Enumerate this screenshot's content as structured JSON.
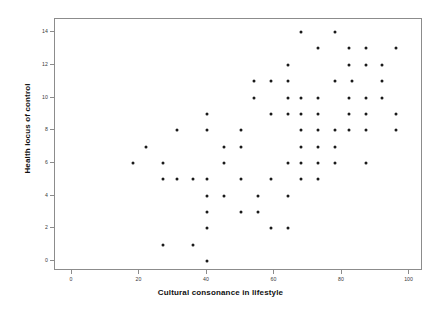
{
  "chart_data": {
    "type": "scatter",
    "title": "",
    "xlabel": "Cultural consonance in lifestyle",
    "ylabel": "Health locus of control",
    "xlim": [
      -5,
      104
    ],
    "ylim": [
      -0.6,
      14.8
    ],
    "xticks": [
      0,
      20,
      40,
      60,
      80,
      100
    ],
    "yticks": [
      0,
      2,
      4,
      6,
      8,
      10,
      12,
      14
    ],
    "xtick_labels": [
      "0",
      "20",
      "40",
      "60",
      "80",
      "100"
    ],
    "ytick_labels": [
      "0",
      "2",
      "4",
      "6",
      "8",
      "10",
      "12",
      "14"
    ],
    "grid": false,
    "legend": null,
    "marker": {
      "shape": "circle",
      "color": "#1a1a1a",
      "size": 3
    },
    "frame_color": "#8c8c8c",
    "background": "#ffffff",
    "points": [
      {
        "x": 68,
        "y": 14
      },
      {
        "x": 78,
        "y": 14
      },
      {
        "x": 73,
        "y": 13
      },
      {
        "x": 82,
        "y": 13
      },
      {
        "x": 87,
        "y": 13
      },
      {
        "x": 96,
        "y": 13
      },
      {
        "x": 64,
        "y": 12
      },
      {
        "x": 82,
        "y": 12
      },
      {
        "x": 87,
        "y": 12
      },
      {
        "x": 92,
        "y": 12
      },
      {
        "x": 54,
        "y": 11
      },
      {
        "x": 59,
        "y": 11
      },
      {
        "x": 64,
        "y": 11
      },
      {
        "x": 78,
        "y": 11
      },
      {
        "x": 83,
        "y": 11
      },
      {
        "x": 92,
        "y": 11
      },
      {
        "x": 54,
        "y": 10
      },
      {
        "x": 64,
        "y": 10
      },
      {
        "x": 68,
        "y": 10
      },
      {
        "x": 73,
        "y": 10
      },
      {
        "x": 82,
        "y": 10
      },
      {
        "x": 87,
        "y": 10
      },
      {
        "x": 92,
        "y": 10
      },
      {
        "x": 40,
        "y": 9
      },
      {
        "x": 59,
        "y": 9
      },
      {
        "x": 64,
        "y": 9
      },
      {
        "x": 68,
        "y": 9
      },
      {
        "x": 73,
        "y": 9
      },
      {
        "x": 82,
        "y": 9
      },
      {
        "x": 87,
        "y": 9
      },
      {
        "x": 96,
        "y": 9
      },
      {
        "x": 31,
        "y": 8
      },
      {
        "x": 40,
        "y": 8
      },
      {
        "x": 50,
        "y": 8
      },
      {
        "x": 68,
        "y": 8
      },
      {
        "x": 73,
        "y": 8
      },
      {
        "x": 78,
        "y": 8
      },
      {
        "x": 82,
        "y": 8
      },
      {
        "x": 87,
        "y": 8
      },
      {
        "x": 96,
        "y": 8
      },
      {
        "x": 22,
        "y": 7
      },
      {
        "x": 45,
        "y": 7
      },
      {
        "x": 50,
        "y": 7
      },
      {
        "x": 68,
        "y": 7
      },
      {
        "x": 73,
        "y": 7
      },
      {
        "x": 78,
        "y": 7
      },
      {
        "x": 18,
        "y": 6
      },
      {
        "x": 27,
        "y": 6
      },
      {
        "x": 45,
        "y": 6
      },
      {
        "x": 64,
        "y": 6
      },
      {
        "x": 68,
        "y": 6
      },
      {
        "x": 73,
        "y": 6
      },
      {
        "x": 78,
        "y": 6
      },
      {
        "x": 87,
        "y": 6
      },
      {
        "x": 27,
        "y": 5
      },
      {
        "x": 31,
        "y": 5
      },
      {
        "x": 36,
        "y": 5
      },
      {
        "x": 40,
        "y": 5
      },
      {
        "x": 50,
        "y": 5
      },
      {
        "x": 59,
        "y": 5
      },
      {
        "x": 68,
        "y": 5
      },
      {
        "x": 73,
        "y": 5
      },
      {
        "x": 40,
        "y": 4
      },
      {
        "x": 45,
        "y": 4
      },
      {
        "x": 55,
        "y": 4
      },
      {
        "x": 64,
        "y": 4
      },
      {
        "x": 40,
        "y": 3
      },
      {
        "x": 50,
        "y": 3
      },
      {
        "x": 55,
        "y": 3
      },
      {
        "x": 40,
        "y": 2
      },
      {
        "x": 59,
        "y": 2
      },
      {
        "x": 64,
        "y": 2
      },
      {
        "x": 27,
        "y": 1
      },
      {
        "x": 36,
        "y": 1
      },
      {
        "x": 40,
        "y": 0
      }
    ]
  }
}
